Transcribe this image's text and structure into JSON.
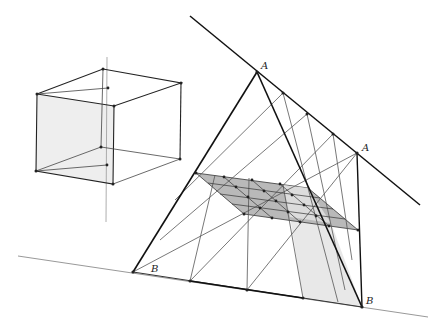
{
  "diagram": {
    "type": "perspective-construction",
    "labels": {
      "apex_top": "A",
      "apex_right": "A",
      "base_left": "B",
      "base_right": "B"
    },
    "colors": {
      "line_dark": "#1a1a1a",
      "line_mid": "#555555",
      "line_light": "#9a9a9a",
      "fill_grid": "#b8b8b8",
      "fill_light": "#e6e6e6",
      "fill_cube_face": "#efefef"
    }
  }
}
